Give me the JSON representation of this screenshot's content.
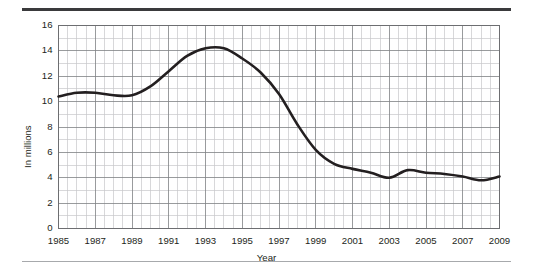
{
  "chart_data": {
    "type": "line",
    "title": "",
    "xlabel": "Year",
    "ylabel": "In millions",
    "xlim": [
      1985,
      2009
    ],
    "ylim": [
      0,
      16
    ],
    "grid": true,
    "legend_position": "none",
    "y_ticks": [
      0,
      2,
      4,
      6,
      8,
      10,
      12,
      14,
      16
    ],
    "y_tick_labels": [
      "0",
      "2",
      "4",
      "6",
      "8",
      "10",
      "12",
      "14",
      "16"
    ],
    "y_minor_step": 1,
    "x_ticks": [
      1985,
      1987,
      1989,
      1991,
      1993,
      1995,
      1997,
      1999,
      2001,
      2003,
      2005,
      2007,
      2009
    ],
    "x_tick_labels": [
      "1985",
      "1987",
      "1989",
      "1991",
      "1993",
      "1995",
      "1997",
      "1999",
      "2001",
      "2003",
      "2005",
      "2007",
      "2009"
    ],
    "x_minor_step": 0.5,
    "series": [
      {
        "name": "In millions",
        "color": "#231f20",
        "x": [
          1985,
          1986,
          1987,
          1988,
          1989,
          1990,
          1991,
          1992,
          1993,
          1994,
          1995,
          1996,
          1997,
          1998,
          1999,
          2000,
          2001,
          2002,
          2003,
          2004,
          2005,
          2006,
          2007,
          2008,
          2009
        ],
        "values": [
          10.4,
          10.7,
          10.7,
          10.5,
          10.5,
          11.2,
          12.4,
          13.6,
          14.2,
          14.2,
          13.4,
          12.3,
          10.6,
          8.2,
          6.2,
          5.1,
          4.7,
          4.4,
          4.0,
          4.6,
          4.4,
          4.3,
          4.1,
          3.8,
          4.1
        ]
      }
    ],
    "annotations": []
  },
  "axes": {
    "y_title": "In millions",
    "x_title": "Year"
  },
  "colors": {
    "line": "#231f20",
    "grid_major": "#808285",
    "grid_minor": "#c7c8ca",
    "border": "#6d6e71",
    "rule_top": "#3a3a3c",
    "rule_bottom": "#a7a9ac",
    "background": "#ffffff"
  }
}
